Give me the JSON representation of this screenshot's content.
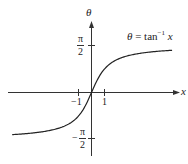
{
  "chart_data": {
    "type": "line",
    "title": "",
    "function": "θ = tan⁻¹ x",
    "xlabel": "x",
    "ylabel": "θ",
    "x_ticks": [
      {
        "value": -1,
        "label": "−1"
      },
      {
        "value": 1,
        "label": "1"
      }
    ],
    "y_ticks": [
      {
        "value": 1.5708,
        "label": "π/2"
      },
      {
        "value": -1.5708,
        "label": "−π/2"
      }
    ],
    "asymptotes": [
      1.5708,
      -1.5708
    ],
    "xlim": [
      -6.5,
      6.7
    ],
    "ylim": [
      -2.1,
      2.4
    ],
    "grid": false,
    "series": [
      {
        "name": "θ = tan⁻¹ x",
        "x": [
          -6.1,
          -5,
          -4,
          -3,
          -2,
          -1.5,
          -1,
          -0.5,
          0,
          0.5,
          1,
          1.5,
          2,
          3,
          4,
          5,
          6.2
        ],
        "values": [
          -1.408,
          -1.373,
          -1.326,
          -1.249,
          -1.107,
          -0.983,
          -0.785,
          -0.464,
          0,
          0.464,
          0.785,
          0.983,
          1.107,
          1.249,
          1.326,
          1.373,
          1.411
        ]
      }
    ]
  },
  "labels": {
    "theta_axis": "θ",
    "x_axis": "x",
    "equation_lhs": "θ",
    "equation_mid": " = tan",
    "equation_sup": "−1",
    "equation_rhs": " x",
    "pi_num": "π",
    "pi_den": "2",
    "neg_sign": "−",
    "tick_neg1": "−1",
    "tick_pos1": "1"
  }
}
